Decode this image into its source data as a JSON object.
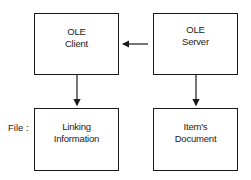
{
  "diagram": {
    "nodes": [
      {
        "id": "client",
        "lines": [
          "OLE",
          "Client"
        ]
      },
      {
        "id": "server",
        "lines": [
          "OLE",
          "Server"
        ]
      },
      {
        "id": "linking",
        "lines": [
          "Linking",
          "Information"
        ]
      },
      {
        "id": "document",
        "lines": [
          "Item's",
          "Document"
        ]
      }
    ],
    "edges": [
      {
        "from": "server",
        "to": "client"
      },
      {
        "from": "client",
        "to": "linking"
      },
      {
        "from": "server",
        "to": "document"
      }
    ],
    "row_label": "File :"
  }
}
